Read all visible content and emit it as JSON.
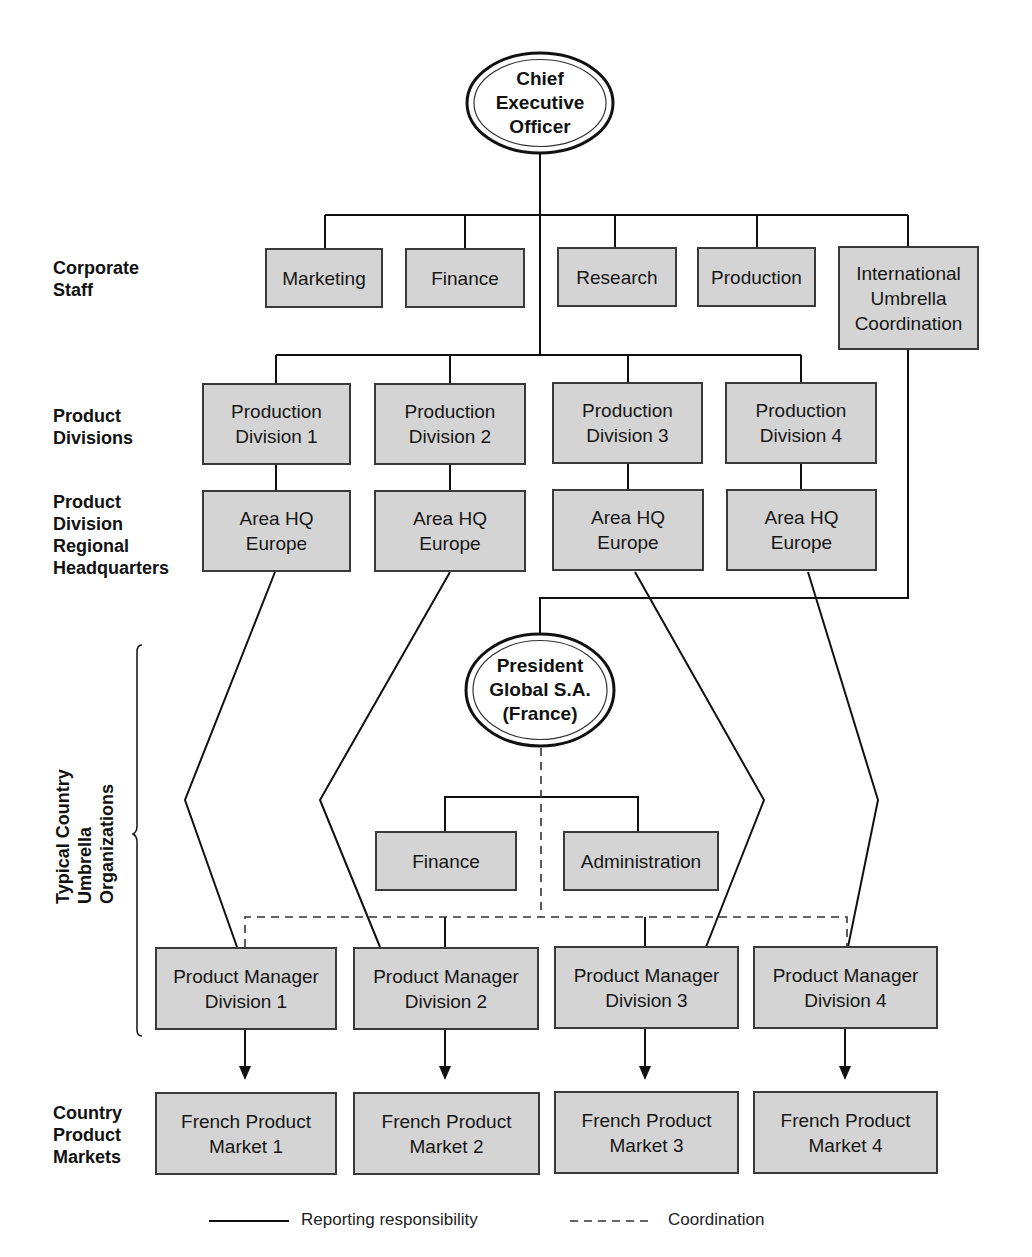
{
  "diagram": {
    "type": "organizational-chart",
    "top": {
      "ceo": "Chief\nExecutive\nOfficer"
    },
    "row_labels": {
      "corporate_staff": "Corporate\nStaff",
      "product_divisions": "Product\nDivisions",
      "regional_hq": "Product\nDivision\nRegional\nHeadquarters",
      "country_umbrella": "Typical Country\nUmbrella\nOrganizations",
      "country_markets": "Country\nProduct\nMarkets"
    },
    "corporate_staff": [
      "Marketing",
      "Finance",
      "Research",
      "Production",
      "International\nUmbrella\nCoordination"
    ],
    "product_divisions": [
      "Production\nDivision 1",
      "Production\nDivision 2",
      "Production\nDivision 3",
      "Production\nDivision 4"
    ],
    "regional_hq": [
      "Area HQ\nEurope",
      "Area HQ\nEurope",
      "Area HQ\nEurope",
      "Area HQ\nEurope"
    ],
    "country_president": "President\nGlobal S.A.\n(France)",
    "country_staff": [
      "Finance",
      "Administration"
    ],
    "product_managers": [
      "Product Manager\nDivision 1",
      "Product Manager\nDivision 2",
      "Product Manager\nDivision 3",
      "Product Manager\nDivision 4"
    ],
    "markets": [
      "French Product\nMarket 1",
      "French Product\nMarket 2",
      "French Product\nMarket 3",
      "French Product\nMarket 4"
    ],
    "legend": {
      "solid": "Reporting responsibility",
      "dashed": "Coordination"
    },
    "colors": {
      "box_fill": "#d4d4d4",
      "line": "#111111",
      "border": "#3a3a3a"
    }
  }
}
